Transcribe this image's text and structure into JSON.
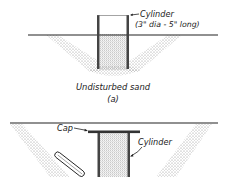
{
  "figure_a": {
    "cylinder_label": "Cylinder",
    "cylinder_size": "(3\" dia - 5\" long)",
    "caption": "Undisturbed sand",
    "panel": "(a)"
  },
  "figure_b": {
    "cap_label": "Cap",
    "cylinder_label": "Cylinder"
  },
  "colors": {
    "ink": "#222222",
    "sand": "#9a9a9a",
    "background": "#ffffff"
  }
}
